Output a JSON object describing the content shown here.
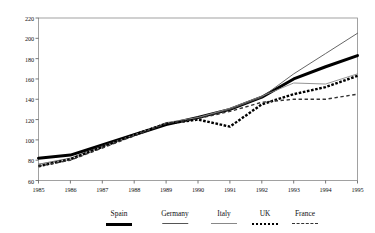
{
  "chart_data": {
    "type": "line",
    "title": "",
    "xlabel": "",
    "ylabel": "",
    "x": [
      1985,
      1986,
      1987,
      1988,
      1989,
      1990,
      1991,
      1992,
      1993,
      1994,
      1995
    ],
    "xtick_labels": [
      "1985",
      "1986",
      "1987",
      "1988",
      "1989",
      "1990",
      "1991",
      "1992",
      "1993",
      "1994",
      "1995"
    ],
    "ytick_labels": [
      "60",
      "80",
      "100",
      "120",
      "140",
      "160",
      "180",
      "200",
      "220"
    ],
    "yticks": [
      60,
      80,
      100,
      120,
      140,
      160,
      180,
      200,
      220
    ],
    "ylim": [
      60,
      220
    ],
    "xlim": [
      1985,
      1995
    ],
    "grid": false,
    "legend_position": "bottom",
    "frame": true,
    "series": [
      {
        "name": "Spain",
        "color": "#000000",
        "style": "solid",
        "width": 3.0,
        "values": [
          82,
          85,
          95,
          105,
          115,
          122,
          130,
          142,
          160,
          172,
          183
        ]
      },
      {
        "name": "Germany",
        "color": "#555555",
        "style": "solid",
        "width": 0.9,
        "values": [
          76,
          82,
          94,
          105,
          116,
          122,
          130,
          142,
          165,
          185,
          205
        ]
      },
      {
        "name": "Italy",
        "color": "#888888",
        "style": "solid",
        "width": 0.9,
        "values": [
          76,
          80,
          93,
          105,
          117,
          122,
          131,
          143,
          156,
          155,
          165
        ]
      },
      {
        "name": "UK",
        "color": "#000000",
        "style": "dotted",
        "width": 2.4,
        "values": [
          74,
          81,
          93,
          105,
          116,
          120,
          113,
          135,
          145,
          152,
          163
        ]
      },
      {
        "name": "France",
        "color": "#333333",
        "style": "dashed",
        "width": 1.4,
        "values": [
          74,
          80,
          92,
          104,
          116,
          121,
          128,
          137,
          140,
          140,
          145
        ]
      }
    ]
  },
  "legend": {
    "items": [
      {
        "label": "Spain"
      },
      {
        "label": "Germany"
      },
      {
        "label": "Italy"
      },
      {
        "label": "UK"
      },
      {
        "label": "France"
      }
    ]
  }
}
